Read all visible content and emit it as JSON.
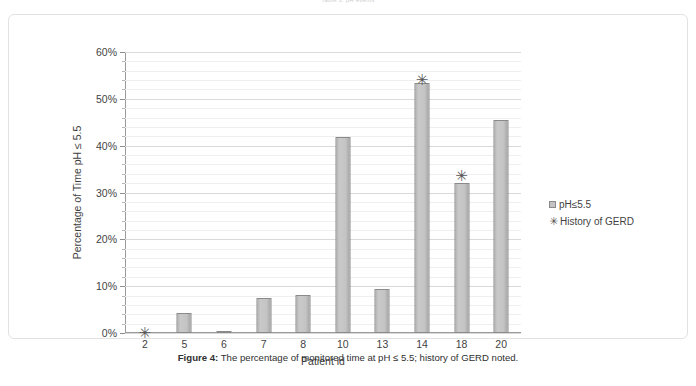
{
  "page": {
    "top_running_text": "Table 3: pH events",
    "caption_label": "Figure 4:",
    "caption_text": " The percentage of monitored time at pH ≤ 5.5; history of GERD noted."
  },
  "legend": {
    "position": "right",
    "items": [
      {
        "label": "pH≤5.5",
        "marker": "square",
        "color": "#c3c3c3"
      },
      {
        "label": "History of GERD",
        "marker": "asterisk",
        "color": "#555555"
      }
    ]
  },
  "chart_data": {
    "type": "bar",
    "title": "",
    "xlabel": "Patient id",
    "ylabel": "Percentage of Time pH ≤ 5.5",
    "categories": [
      "2",
      "5",
      "6",
      "7",
      "8",
      "10",
      "13",
      "14",
      "18",
      "20"
    ],
    "series": [
      {
        "name": "pH≤5.5",
        "values": [
          0,
          4.3,
          0.3,
          7.5,
          8.2,
          41.9,
          9.4,
          53.4,
          32.0,
          45.5
        ]
      }
    ],
    "overlay_markers": {
      "name": "History of GERD",
      "marker": "asterisk",
      "points": [
        {
          "category": "2",
          "value": 0
        },
        {
          "category": "14",
          "value": 54.0
        },
        {
          "category": "18",
          "value": 33.5
        }
      ]
    },
    "ylim": [
      0,
      60
    ],
    "yticks": [
      0,
      10,
      20,
      30,
      40,
      50,
      60
    ],
    "ytick_labels": [
      "0%",
      "10%",
      "20%",
      "30%",
      "40%",
      "50%",
      "60%"
    ],
    "yminor_step": 2,
    "grid": true,
    "bar_color": "#c3c3c3",
    "bar_border_color": "#8a8a8a",
    "axis_color": "#9a9a9a",
    "gridline_color": "#d9d9d9",
    "minor_gridline_color": "#f0eeee"
  }
}
